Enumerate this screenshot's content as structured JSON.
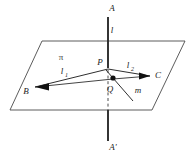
{
  "figure": {
    "background_color": "#ffffff",
    "stroke_color": "#2f2f2f",
    "plane_edge_color": "#4a4a4a",
    "dot_color": "#111111",
    "labels": {
      "axis_top": "A",
      "axis_bottom": "A'",
      "line_l": "l",
      "plane": "π",
      "point_p": "P",
      "point_q": "Q",
      "point_b": "B",
      "point_c": "C",
      "ray_l1": "l",
      "ray_l1_sub": "1",
      "ray_l2": "l",
      "ray_l2_sub": "2",
      "ray_m": "m"
    },
    "geometry": {
      "plane_polygon": "42,41 185,41 152,110 10,110",
      "axis_x": 108,
      "axis_top_y": 17,
      "axis_bottom_y": 141,
      "point_p": {
        "x": 108,
        "y": 68
      },
      "point_q": {
        "x": 113,
        "y": 78
      },
      "point_b": {
        "x": 35,
        "y": 87
      },
      "point_c": {
        "x": 150,
        "y": 76
      },
      "ray_m_end": {
        "x": 133,
        "y": 101
      }
    }
  }
}
